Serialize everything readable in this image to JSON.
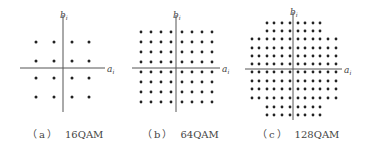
{
  "figure": {
    "panels": [
      {
        "id": "a",
        "label": "（a）",
        "name": "16QAM",
        "caption_x": 27,
        "axis_x_label": "a",
        "axis_y_label": "b",
        "subscript": "i",
        "grid": {
          "cols": 4,
          "rows": 4
        },
        "cx": 63,
        "cy": 68,
        "xs": [
          36,
          54,
          72,
          89
        ],
        "ys": [
          42,
          61,
          78,
          97
        ],
        "hline": [
          20,
          105
        ],
        "vline": [
          15,
          112
        ]
      },
      {
        "id": "b",
        "label": "（b）",
        "name": "64QAM",
        "caption_x": 142,
        "axis_x_label": "a",
        "axis_y_label": "b",
        "subscript": "i",
        "grid": {
          "cols": 8,
          "rows": 8
        },
        "cx": 176,
        "cy": 68,
        "xs": [
          141,
          151,
          161,
          171,
          182,
          192,
          202,
          212
        ],
        "ys": [
          32,
          42,
          52,
          62,
          72,
          82,
          92,
          102
        ],
        "hline": [
          132,
          220
        ],
        "vline": [
          15,
          112
        ]
      },
      {
        "id": "c",
        "label": "（c）",
        "name": "128QAM",
        "caption_x": 257,
        "axis_x_label": "a",
        "axis_y_label": "b",
        "subscript": "i",
        "grid": {
          "cols": 12,
          "rows": 12,
          "cross_shape": true,
          "corner_cut": 2
        },
        "cx": 293,
        "cy": 69,
        "xs": [
          252,
          259,
          267,
          274,
          282,
          290,
          298,
          305,
          313,
          320,
          328,
          336
        ],
        "ys": [
          23,
          31,
          39,
          48,
          56,
          64,
          72,
          81,
          89,
          98,
          107,
          115
        ],
        "hline": [
          245,
          342
        ],
        "vline": [
          12,
          120
        ]
      }
    ],
    "colors": {
      "dot": "#222222",
      "axis": "#555555",
      "text": "#444444"
    }
  }
}
